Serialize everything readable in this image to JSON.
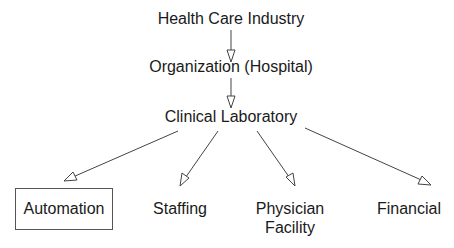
{
  "diagram": {
    "type": "hierarchy",
    "nodes": [
      {
        "id": "health_care",
        "label": "Health Care Industry"
      },
      {
        "id": "organization",
        "label": "Organization (Hospital)"
      },
      {
        "id": "clinical_lab",
        "label": "Clinical Laboratory"
      },
      {
        "id": "automation",
        "label": "Automation",
        "boxed": true
      },
      {
        "id": "staffing",
        "label": "Staffing"
      },
      {
        "id": "physician_facility",
        "label_line1": "Physician",
        "label_line2": "Facility"
      },
      {
        "id": "financial",
        "label": "Financial"
      }
    ],
    "edges": [
      {
        "from": "health_care",
        "to": "organization"
      },
      {
        "from": "organization",
        "to": "clinical_lab"
      },
      {
        "from": "clinical_lab",
        "to": "automation"
      },
      {
        "from": "clinical_lab",
        "to": "staffing"
      },
      {
        "from": "clinical_lab",
        "to": "physician_facility"
      },
      {
        "from": "clinical_lab",
        "to": "financial"
      }
    ],
    "colors": {
      "line": "#444444",
      "text": "#1a1a1a",
      "background": "#ffffff"
    }
  }
}
